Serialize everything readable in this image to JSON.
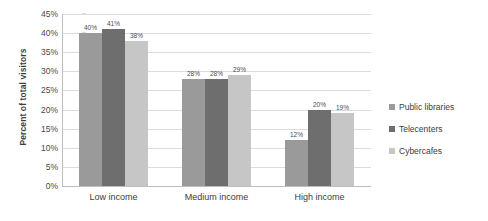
{
  "chart_data": {
    "type": "bar",
    "title": "",
    "subtitle": "",
    "xlabel": "",
    "ylabel": "Percent of total visitors",
    "categories": [
      "Low income",
      "Medium income",
      "High income"
    ],
    "series": [
      {
        "name": "Public libraries",
        "color": "#9a9a9a",
        "values": [
          40,
          28,
          12
        ],
        "labels": [
          "40%",
          "28%",
          "12%"
        ]
      },
      {
        "name": "Telecenters",
        "color": "#6e6e6e",
        "values": [
          41,
          28,
          20
        ],
        "labels": [
          "41%",
          "28%",
          "20%"
        ]
      },
      {
        "name": "Cybercafes",
        "color": "#c6c6c6",
        "values": [
          38,
          29,
          19
        ],
        "labels": [
          "38%",
          "29%",
          "19%"
        ]
      }
    ],
    "ylim": [
      0,
      45
    ],
    "ytick_step": 5,
    "ytick_labels": [
      "0%",
      "5%",
      "10%",
      "15%",
      "20%",
      "25%",
      "30%",
      "35%",
      "40%",
      "45%"
    ],
    "ytick_values": [
      0,
      5,
      10,
      15,
      20,
      25,
      30,
      35,
      40,
      45
    ],
    "grid": true,
    "grid_axis": "y",
    "legend_position": "right",
    "value_labels_shown": true,
    "plot_background": "#ffffff",
    "gridline_color": "#dcdcdc",
    "axis_color": "#bdbdbd"
  }
}
